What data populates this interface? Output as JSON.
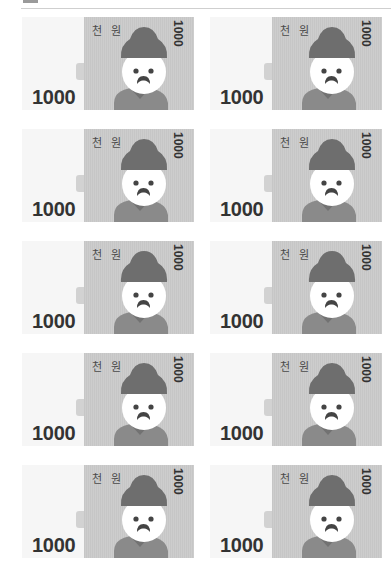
{
  "page": {
    "layout": "2-column grid of printable play-money banknotes",
    "rows": 5,
    "columns": 2
  },
  "colors": {
    "note_left_bg": "#f6f6f6",
    "note_main_bg": "#c9c9c9",
    "hair": "#6e6e6e",
    "face": "#ffffff",
    "body": "#8a8a8a",
    "collar": "#707070",
    "text": "#333333"
  },
  "notes": [
    {
      "denomination_big": "1000",
      "label_kr": "천 원",
      "denomination_vertical": "1000"
    },
    {
      "denomination_big": "1000",
      "label_kr": "천 원",
      "denomination_vertical": "1000"
    },
    {
      "denomination_big": "1000",
      "label_kr": "천 원",
      "denomination_vertical": "1000"
    },
    {
      "denomination_big": "1000",
      "label_kr": "천 원",
      "denomination_vertical": "1000"
    },
    {
      "denomination_big": "1000",
      "label_kr": "천 원",
      "denomination_vertical": "1000"
    },
    {
      "denomination_big": "1000",
      "label_kr": "천 원",
      "denomination_vertical": "1000"
    },
    {
      "denomination_big": "1000",
      "label_kr": "천 원",
      "denomination_vertical": "1000"
    },
    {
      "denomination_big": "1000",
      "label_kr": "천 원",
      "denomination_vertical": "1000"
    },
    {
      "denomination_big": "1000",
      "label_kr": "천 원",
      "denomination_vertical": "1000"
    },
    {
      "denomination_big": "1000",
      "label_kr": "천 원",
      "denomination_vertical": "1000"
    }
  ]
}
